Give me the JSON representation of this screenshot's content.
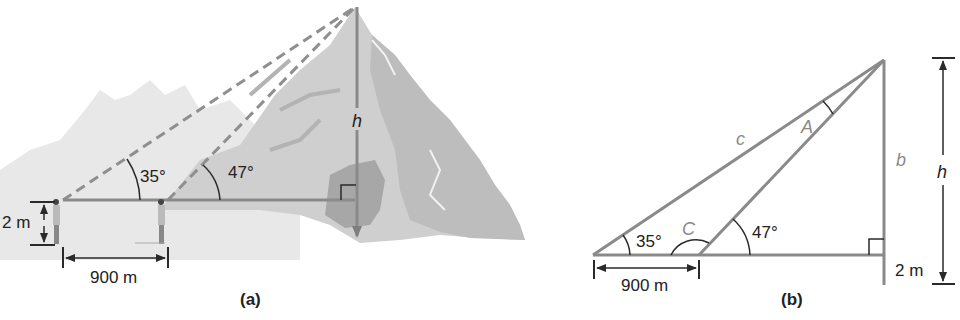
{
  "colors": {
    "line": "#8a8a8a",
    "dark_line": "#2a2a2a",
    "mountain_light": "#d9d9d9",
    "mountain_mid": "#c2c2c2",
    "mountain_dark": "#a9a9a9",
    "background_hills": "#e6e6e6",
    "label_gray": "#8a8a8a"
  },
  "panel_a": {
    "caption": "(a)",
    "angle_1": "35°",
    "angle_2": "47°",
    "height_label": "h",
    "distance_label": "900 m",
    "eye_height_label": "2 m",
    "icons": [
      "mountain-illustration",
      "observer-figure",
      "observer-figure",
      "right-angle-marker"
    ]
  },
  "panel_b": {
    "caption": "(b)",
    "angle_1": "35°",
    "angle_2": "47°",
    "vertex_label_A": "A",
    "vertex_label_C": "C",
    "side_label_c": "c",
    "side_label_b": "b",
    "height_label": "h",
    "distance_label": "900 m",
    "eye_height_label": "2 m"
  }
}
